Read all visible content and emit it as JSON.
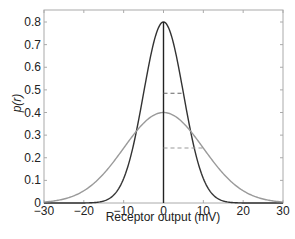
{
  "chart_data": {
    "type": "line",
    "title": "",
    "xlabel": "Receptor output (mV)",
    "ylabel": "p(r)",
    "xlim": [
      -30,
      30
    ],
    "ylim": [
      0,
      0.85
    ],
    "xticks": [
      -30,
      -20,
      -10,
      0,
      10,
      20,
      30
    ],
    "yticks": [
      0,
      0.1,
      0.2,
      0.3,
      0.4,
      0.5,
      0.6,
      0.7,
      0.8
    ],
    "xtick_labels": [
      "−30",
      "−20",
      "−10",
      "0",
      "10",
      "20",
      "30"
    ],
    "ytick_labels": [
      "0",
      "0.1",
      "0.2",
      "0.3",
      "0.4",
      "0.5",
      "0.6",
      "0.7",
      "0.8"
    ],
    "grid": false,
    "legend": null,
    "series": [
      {
        "name": "narrow Gaussian",
        "color": "#333333",
        "mean": 0,
        "sigma": 5,
        "peak": 0.8
      },
      {
        "name": "wide Gaussian",
        "color": "#9a9a9a",
        "mean": 0,
        "sigma": 10,
        "peak": 0.4
      }
    ],
    "annotations": [
      {
        "type": "vline",
        "x": 0,
        "y0": 0,
        "y1": 0.8,
        "color": "#222222"
      },
      {
        "type": "dashed-hline",
        "y": 0.485,
        "x0": 0,
        "x1": 5,
        "color": "#666666"
      },
      {
        "type": "dashed-hline",
        "y": 0.243,
        "x0": 0,
        "x1": 10,
        "color": "#999999"
      }
    ]
  },
  "colors": {
    "axis": "#aaaaaa",
    "text": "#222222"
  }
}
